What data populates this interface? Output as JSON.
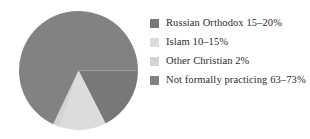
{
  "chart_data": {
    "type": "pie",
    "title": "",
    "subtitle": "",
    "xlabel": "",
    "ylabel": "",
    "legend_position": "right",
    "grid": false,
    "categories": [
      "Russian Orthodox 15–20%",
      "Islam 10–15%",
      "Other Christian 2%",
      "Not formally practicing 63–73%"
    ],
    "values": [
      17.5,
      12.5,
      2,
      68
    ],
    "value_ranges": [
      {
        "label": "Russian Orthodox",
        "min": 15,
        "max": 20,
        "display": "15–20%"
      },
      {
        "label": "Islam",
        "min": 10,
        "max": 15,
        "display": "10–15%"
      },
      {
        "label": "Other Christian",
        "min": 2,
        "max": 2,
        "display": "2%"
      },
      {
        "label": "Not formally practicing",
        "min": 63,
        "max": 73,
        "display": "63–73%"
      }
    ],
    "colors": [
      "#76787a",
      "#dcdcdc",
      "#d2d3d4",
      "#808284"
    ],
    "slice_geometry": {
      "center_x": 60,
      "center_y": 60,
      "radius": 59,
      "start_angle_deg": 0,
      "direction": "clockwise"
    }
  },
  "legend": {
    "items": [
      {
        "label": "Russian Orthodox 15–20%",
        "color": "#76787a"
      },
      {
        "label": "Islam 10–15%",
        "color": "#dcdcdc"
      },
      {
        "label": "Other Christian 2%",
        "color": "#d2d3d4"
      },
      {
        "label": "Not formally practicing 63–73%",
        "color": "#808284"
      }
    ]
  }
}
